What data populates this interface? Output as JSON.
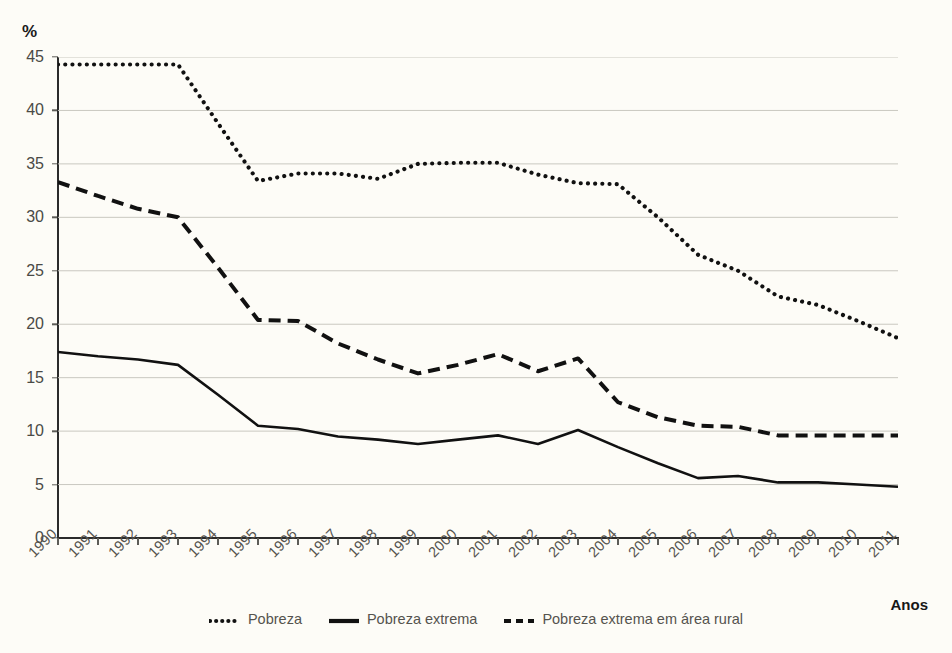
{
  "chart_data": {
    "type": "line",
    "title": "",
    "subtitle": "",
    "xlabel": "Anos",
    "ylabel": "%",
    "unit_label": "%",
    "grid": true,
    "legend_position": "bottom-center",
    "xlim": [
      1990,
      2011
    ],
    "ylim": [
      0,
      45
    ],
    "y_ticks": [
      0,
      5,
      10,
      15,
      20,
      25,
      30,
      35,
      40,
      45
    ],
    "categories": [
      "1990",
      "1991",
      "1992",
      "1993",
      "1994",
      "1995",
      "1996",
      "1997",
      "1998",
      "1999",
      "2000",
      "2001",
      "2002",
      "2003",
      "2004",
      "2005",
      "2006",
      "2007",
      "2008",
      "2009",
      "2010",
      "2011"
    ],
    "series": [
      {
        "name": "Pobreza",
        "style": "dotted",
        "color": "#111111",
        "values": [
          44.3,
          44.3,
          44.3,
          44.3,
          38.8,
          33.4,
          34.1,
          34.1,
          33.6,
          35.0,
          35.1,
          35.1,
          34.0,
          33.2,
          33.1,
          30.0,
          26.5,
          25.0,
          22.6,
          21.8,
          20.3,
          18.7
        ]
      },
      {
        "name": "Pobreza extrema",
        "style": "solid",
        "color": "#111111",
        "values": [
          17.4,
          17.0,
          16.7,
          16.2,
          13.4,
          10.5,
          10.2,
          9.5,
          9.2,
          8.8,
          9.2,
          9.6,
          8.8,
          10.1,
          8.5,
          7.0,
          5.6,
          5.8,
          5.2,
          5.2,
          5.0,
          4.8
        ]
      },
      {
        "name": "Pobreza extrema em área rural",
        "style": "dashed",
        "color": "#111111",
        "values": [
          33.3,
          32.0,
          30.8,
          30.0,
          25.3,
          20.4,
          20.3,
          18.2,
          16.7,
          15.4,
          16.2,
          17.2,
          15.6,
          16.8,
          12.7,
          11.3,
          10.5,
          10.4,
          9.6,
          9.6,
          9.6,
          9.6
        ]
      }
    ]
  },
  "legend": {
    "items": [
      {
        "label": "Pobreza",
        "style": "dotted"
      },
      {
        "label": "Pobreza extrema",
        "style": "solid"
      },
      {
        "label": "Pobreza extrema em área rural",
        "style": "dashed"
      }
    ]
  },
  "axis": {
    "x_title": "Anos",
    "y_unit": "%"
  },
  "colors": {
    "background": "#fdfcf7",
    "grid": "#c9c8c0",
    "axis": "#2b2b2b",
    "tick_text": "#55534e",
    "series": "#111111"
  }
}
